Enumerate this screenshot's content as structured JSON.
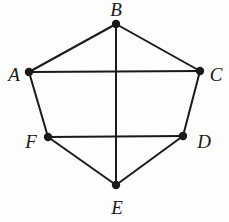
{
  "figure": {
    "background_color": "#fdfdfc",
    "stroke_color": "#1a1a1a",
    "width": 229,
    "height": 222
  },
  "graph": {
    "vertices": [
      {
        "id": "A",
        "label": "A",
        "x": 29,
        "y": 72,
        "label_x": 14,
        "label_y": 74
      },
      {
        "id": "B",
        "label": "B",
        "x": 116,
        "y": 24,
        "label_x": 116,
        "label_y": 9
      },
      {
        "id": "C",
        "label": "C",
        "x": 200,
        "y": 71,
        "label_x": 216,
        "label_y": 74
      },
      {
        "id": "D",
        "label": "D",
        "x": 183,
        "y": 136,
        "label_x": 204,
        "label_y": 141
      },
      {
        "id": "E",
        "label": "E",
        "x": 116,
        "y": 185,
        "label_x": 117,
        "label_y": 207
      },
      {
        "id": "F",
        "label": "F",
        "x": 48,
        "y": 137,
        "label_x": 31,
        "label_y": 141
      }
    ],
    "edges": [
      {
        "from": "A",
        "to": "B",
        "kind": "perimeter"
      },
      {
        "from": "B",
        "to": "C",
        "kind": "perimeter"
      },
      {
        "from": "C",
        "to": "D",
        "kind": "perimeter"
      },
      {
        "from": "D",
        "to": "E",
        "kind": "perimeter"
      },
      {
        "from": "E",
        "to": "F",
        "kind": "perimeter"
      },
      {
        "from": "F",
        "to": "A",
        "kind": "perimeter"
      },
      {
        "from": "A",
        "to": "C",
        "kind": "chord"
      },
      {
        "from": "F",
        "to": "D",
        "kind": "chord"
      },
      {
        "from": "B",
        "to": "E",
        "kind": "chord"
      }
    ],
    "vertex_radius": 4.2,
    "edge_width": 2.0
  }
}
